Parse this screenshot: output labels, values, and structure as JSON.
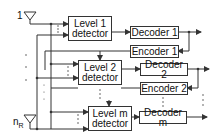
{
  "diagram": {
    "type": "block-diagram",
    "antennas": [
      {
        "label": "1"
      },
      {
        "label_main": "n",
        "label_sub": "R"
      }
    ],
    "detectors": [
      {
        "line1": "Level 1",
        "line2": "detector"
      },
      {
        "line1": "Level 2",
        "line2": "detector"
      },
      {
        "line1": "Level m",
        "line2": "detector"
      }
    ],
    "decoders": [
      {
        "label": "Decoder 1"
      },
      {
        "label": "Decoder 2"
      },
      {
        "label": "Decoder m"
      }
    ],
    "encoders": [
      {
        "label": "Encoder 1"
      },
      {
        "label": "Encoder 2"
      }
    ],
    "colors": {
      "line": "#333333",
      "dots": "#555555",
      "text": "#111111",
      "background": "#ffffff"
    }
  }
}
